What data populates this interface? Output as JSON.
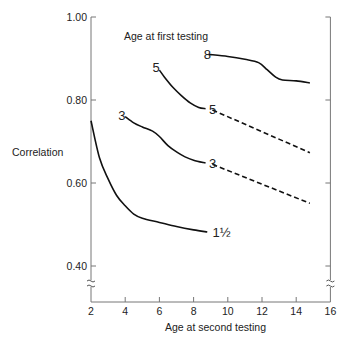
{
  "chart_data": {
    "type": "line",
    "title": "",
    "xlabel": "Age at second testing",
    "ylabel": "Correlation",
    "legend_title": "Age at first testing",
    "xlim": [
      2,
      16
    ],
    "ylim": [
      0.4,
      1.0
    ],
    "x_ticks": [
      2,
      4,
      6,
      8,
      10,
      12,
      14,
      16
    ],
    "x_tick_labels": [
      "2",
      "4",
      "6",
      "8",
      "10",
      "12",
      "14",
      "16"
    ],
    "y_ticks": [
      0.4,
      0.6,
      0.8,
      1.0
    ],
    "y_tick_labels": [
      "0.40",
      "0.60",
      "0.80",
      "1.00"
    ],
    "grid": false,
    "axis_break": true,
    "series": [
      {
        "name": "1½",
        "style": "solid",
        "points": [
          [
            2,
            0.75
          ],
          [
            2.5,
            0.66
          ],
          [
            3,
            0.61
          ],
          [
            3.5,
            0.57
          ],
          [
            4,
            0.545
          ],
          [
            4.5,
            0.525
          ],
          [
            5,
            0.515
          ],
          [
            6,
            0.505
          ],
          [
            7,
            0.495
          ],
          [
            8,
            0.487
          ],
          [
            8.8,
            0.482
          ]
        ]
      },
      {
        "name": "3",
        "style": "solid",
        "points": [
          [
            4,
            0.76
          ],
          [
            4.5,
            0.745
          ],
          [
            5,
            0.735
          ],
          [
            5.6,
            0.725
          ],
          [
            6,
            0.712
          ],
          [
            6.5,
            0.69
          ],
          [
            7,
            0.675
          ],
          [
            7.5,
            0.663
          ],
          [
            8,
            0.655
          ],
          [
            8.7,
            0.648
          ]
        ]
      },
      {
        "name": "3 (projected)",
        "style": "dashed",
        "points": [
          [
            9.1,
            0.645
          ],
          [
            14.8,
            0.551
          ]
        ]
      },
      {
        "name": "5",
        "style": "solid",
        "points": [
          [
            6,
            0.872
          ],
          [
            6.3,
            0.855
          ],
          [
            6.8,
            0.83
          ],
          [
            7.3,
            0.81
          ],
          [
            7.8,
            0.793
          ],
          [
            8.3,
            0.782
          ],
          [
            8.7,
            0.779
          ]
        ]
      },
      {
        "name": "5 (projected)",
        "style": "dashed",
        "points": [
          [
            9.1,
            0.776
          ],
          [
            14.8,
            0.673
          ]
        ]
      },
      {
        "name": "8",
        "style": "solid",
        "points": [
          [
            8.9,
            0.91
          ],
          [
            10,
            0.905
          ],
          [
            11,
            0.898
          ],
          [
            11.8,
            0.89
          ],
          [
            12.3,
            0.873
          ],
          [
            12.8,
            0.855
          ],
          [
            13.2,
            0.848
          ],
          [
            14,
            0.846
          ],
          [
            14.8,
            0.841
          ]
        ]
      }
    ],
    "curve_labels": [
      {
        "text": "1½",
        "x": 9.1,
        "y": 0.482
      },
      {
        "text": "3",
        "x": 3.6,
        "y": 0.765
      },
      {
        "text": "3",
        "x": 8.9,
        "y": 0.647
      },
      {
        "text": "5",
        "x": 5.6,
        "y": 0.88
      },
      {
        "text": "5",
        "x": 8.9,
        "y": 0.778
      },
      {
        "text": "8",
        "x": 8.6,
        "y": 0.912
      }
    ]
  }
}
